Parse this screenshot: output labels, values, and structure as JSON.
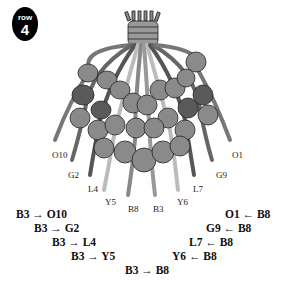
{
  "badge": {
    "word": "row",
    "number": "4"
  },
  "strand_labels": [
    {
      "id": "O10",
      "x": 52,
      "y": 150
    },
    {
      "id": "G2",
      "x": 68,
      "y": 170
    },
    {
      "id": "L4",
      "x": 88,
      "y": 184
    },
    {
      "id": "Y5",
      "x": 105,
      "y": 197
    },
    {
      "id": "B8",
      "x": 128,
      "y": 204
    },
    {
      "id": "B3",
      "x": 153,
      "y": 204
    },
    {
      "id": "Y6",
      "x": 177,
      "y": 197
    },
    {
      "id": "L7",
      "x": 193,
      "y": 184
    },
    {
      "id": "G9",
      "x": 216,
      "y": 170
    },
    {
      "id": "O1",
      "x": 232,
      "y": 150
    }
  ],
  "rules": {
    "left": [
      {
        "text": "B3 → O10",
        "x": 16,
        "y": 208
      },
      {
        "text": "B3 → G2",
        "x": 34,
        "y": 222
      },
      {
        "text": "B3 → L4",
        "x": 52,
        "y": 236
      },
      {
        "text": "B3 → Y5",
        "x": 71,
        "y": 250
      }
    ],
    "right": [
      {
        "text": "O1 ← B8",
        "x": 225,
        "y": 208
      },
      {
        "text": "G9 ← B8",
        "x": 206,
        "y": 222
      },
      {
        "text": "L7 ← B8",
        "x": 189,
        "y": 236
      },
      {
        "text": "Y6 ← B8",
        "x": 172,
        "y": 250
      }
    ],
    "center": {
      "text": "B3 → B8",
      "x": 125,
      "y": 264
    }
  }
}
